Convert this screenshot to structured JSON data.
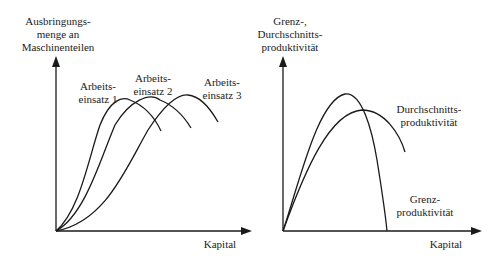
{
  "left_chart": {
    "y_axis_label": [
      "Ausbringungs-",
      "menge an",
      "Maschinenteilen"
    ],
    "x_axis_label": "Kapital",
    "curves": [
      {
        "label": [
          "Arbeits-",
          "einsatz 1"
        ]
      },
      {
        "label": [
          "Arbeits-",
          "einsatz 2"
        ]
      },
      {
        "label": [
          "Arbeits-",
          "einsatz 3"
        ]
      }
    ]
  },
  "right_chart": {
    "y_axis_label": [
      "Grenz-,",
      "Durchschnitts-",
      "produktivität"
    ],
    "x_axis_label": "Kapital",
    "curves": [
      {
        "label": [
          "Durchschnitts-",
          "produktivität"
        ]
      },
      {
        "label": [
          "Grenz-",
          "produktivität"
        ]
      }
    ]
  },
  "colors": {
    "line": "#1a1a1a",
    "background": "#ffffff"
  }
}
